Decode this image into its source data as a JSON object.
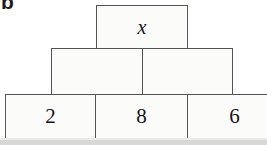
{
  "part_label": "b",
  "puzzle": {
    "rows": [
      {
        "name": "top-row",
        "cells": [
          {
            "value": "x",
            "style": "variable"
          }
        ]
      },
      {
        "name": "middle-row",
        "cells": [
          {
            "value": "",
            "style": "empty"
          },
          {
            "value": "",
            "style": "empty"
          }
        ]
      },
      {
        "name": "bottom-row",
        "cells": [
          {
            "value": "2",
            "style": "number"
          },
          {
            "value": "8",
            "style": "number"
          },
          {
            "value": "6",
            "style": "number"
          }
        ]
      }
    ]
  },
  "colors": {
    "ink": "#14141a",
    "border": "#555558",
    "fill": "#fbfbfa",
    "page": "#ffffff",
    "scan_edge": "#d8d8d6"
  }
}
